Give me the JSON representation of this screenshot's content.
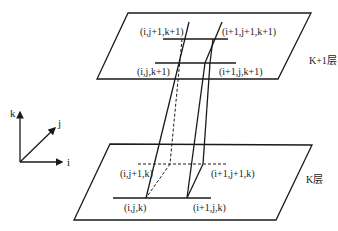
{
  "diagram": {
    "upper_layer": {
      "name": "K+1层",
      "nodes": {
        "ij1": "(i,j+1,k+1)",
        "i1j1": "(i+1,j+1,k+1)",
        "ij": "(i,j,k+1)",
        "i1j": "(i+1,j,k+1)"
      }
    },
    "lower_layer": {
      "name": "K层",
      "nodes": {
        "ij1": "(i,j+1,k)",
        "i1j1": "(i+1,j+1,k)",
        "ij": "(i,j,k)",
        "i1j": "(i+1,j,k)"
      }
    },
    "axes": {
      "k": "k",
      "j": "j",
      "i": "i"
    },
    "colors": {
      "line": "#1a1a1a",
      "background": "#ffffff"
    }
  }
}
